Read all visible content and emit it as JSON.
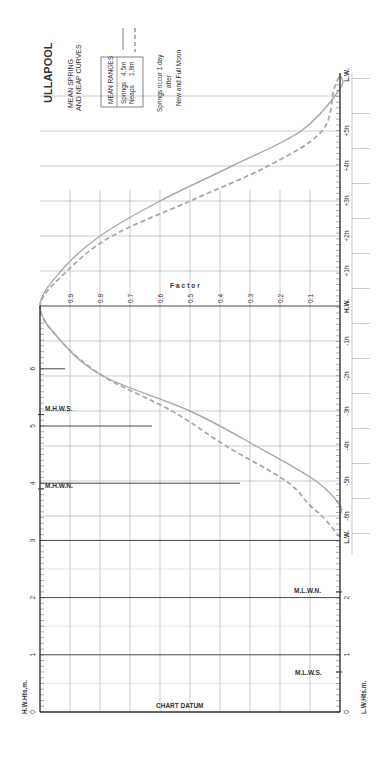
{
  "title": "ULLAPOOL",
  "subtitle_line1": "MEAN SPRING",
  "subtitle_line2": "AND NEAP CURVES",
  "legend": {
    "header": "MEAN RANGES",
    "entries": [
      {
        "name": "Springs",
        "range": "4.5m",
        "style": "solid"
      },
      {
        "name": "Neaps",
        "range": "1.8m",
        "style": "dashed"
      }
    ]
  },
  "note_line1": "Springs occur 1 day",
  "note_line2": "after",
  "note_line3": "New and Full Moon",
  "axis_labels": {
    "hw_heights": "H.W.Hts.m.",
    "lw_heights": "L.W.Hts.m.",
    "factor": "Factor",
    "chart_datum": "CHART DATUM"
  },
  "level_labels": {
    "mhws": "M.H.W.S.",
    "mhwn": "M.H.W.N.",
    "mlwn": "M.L.W.N.",
    "mlws": "M.L.W.S."
  },
  "colors": {
    "curve": "#a8a8a8",
    "axis": "#333333",
    "grid": "#9a9a9a",
    "grid_light": "#cfcfcf",
    "text": "#333333"
  },
  "chart_data": {
    "type": "line",
    "xlabel": "Time relative to High Water (hours)",
    "ylabel": "Factor",
    "ylim": [
      0,
      1
    ],
    "factor_ticks": [
      "0.1",
      "0.2",
      "0.3",
      "0.4",
      "0.5",
      "0.6",
      "0.7",
      "0.8",
      "0.9"
    ],
    "time_ticks": [
      "L.W.",
      "-6h",
      "-5h",
      "-4h",
      "-3h",
      "-2h",
      "-1h",
      "H.W.",
      "+1h",
      "+2h",
      "+3h",
      "+4h",
      "+5h",
      "L.W."
    ],
    "hw_height_ticks": [
      "0",
      "1",
      "2",
      "3",
      "4",
      "5",
      "6"
    ],
    "lw_height_ticks": [
      "0",
      "1",
      "2"
    ],
    "x": [
      -6.6,
      -6,
      -5.7,
      -5,
      -4,
      -3,
      -2,
      -1,
      0,
      1,
      2,
      3,
      4,
      5,
      6.2,
      6.6
    ],
    "series": [
      {
        "name": "Springs (4.5m)",
        "style": "solid",
        "values": [
          0,
          0,
          0,
          0.08,
          0.28,
          0.5,
          0.79,
          0.93,
          1.0,
          0.93,
          0.8,
          0.6,
          0.36,
          0.13,
          0,
          0
        ]
      },
      {
        "name": "Neaps (1.8m)",
        "style": "dashed",
        "values": [
          0,
          0.06,
          0.1,
          0.18,
          0.38,
          0.56,
          0.79,
          0.93,
          1.0,
          0.91,
          0.76,
          0.5,
          0.24,
          0.06,
          0.02,
          0
        ]
      }
    ],
    "levels_m": {
      "MHWS": 5.2,
      "MHWN": 3.9,
      "MLWN": 2.1,
      "MLWS": 0.7
    },
    "mean_ranges_m": {
      "Springs": 4.5,
      "Neaps": 1.8
    },
    "orientation": "rotated 90deg counter-clockwise"
  }
}
